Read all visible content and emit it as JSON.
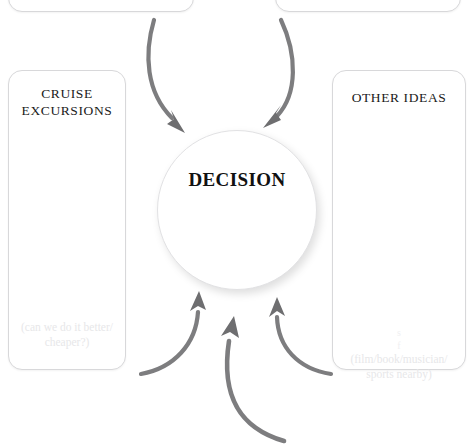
{
  "diagram": {
    "type": "decision-hub-diagram",
    "center": {
      "label": "DECISION",
      "shape": "circle"
    },
    "cards": [
      {
        "id": "top-left",
        "title": "",
        "note": "",
        "visible": "partial-cropped-top"
      },
      {
        "id": "top-right",
        "title": "",
        "note": "",
        "visible": "partial-cropped-top"
      },
      {
        "id": "left",
        "title": "CRUISE\nEXCURSIONS",
        "note": "(can we do it better/\ncheaper?)",
        "visible": "full"
      },
      {
        "id": "right",
        "title": "OTHER IDEAS",
        "note_top": "s\nf",
        "note": "(film/book/musician/\nsports nearby)",
        "visible": "full"
      }
    ],
    "arrows": {
      "count": 5,
      "color": "#7d7d7f",
      "description": "two curved arrows sweep down from the top cards into the circle; three curved arrows sweep up from below into the circle",
      "directions": [
        "top-left-to-center",
        "top-right-to-center",
        "bottom-left-to-center",
        "bottom-center-to-center",
        "bottom-right-to-center"
      ]
    },
    "colors": {
      "background": "#ffffff",
      "card_border": "#d8d8da",
      "title_text": "#1a1a1a",
      "note_text": "#e7e7e9",
      "arrow": "#7d7d7f",
      "circle_border": "#e2e2e4"
    }
  }
}
